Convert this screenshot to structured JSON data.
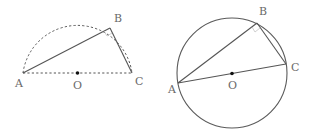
{
  "figures": [
    {
      "id": "semicircle-figure",
      "description": "Semicircle on diameter AC with center O; point B on the arc; triangle ABC",
      "labels": {
        "A": "A",
        "B": "B",
        "C": "C",
        "O": "O"
      },
      "styles": {
        "arc": "dashed",
        "diameter": "dashed",
        "chords": "solid"
      }
    },
    {
      "id": "circle-figure",
      "description": "Full circle with center O; AC is a diameter; B on the circle; triangle ABC inscribed",
      "labels": {
        "A": "A",
        "B": "B",
        "C": "C",
        "O": "O"
      },
      "styles": {
        "circle": "solid",
        "diameter": "solid",
        "chords": "solid"
      }
    }
  ],
  "colors": {
    "stroke": "#555555",
    "label": "#6a6a6a",
    "center_point": "#111111",
    "background": "#ffffff"
  }
}
